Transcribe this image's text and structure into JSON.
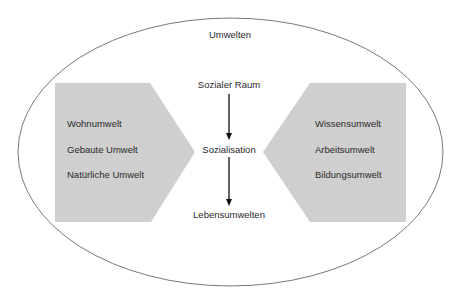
{
  "diagram": {
    "outer_label": "Umwelten",
    "center_flow": [
      "Sozialer Raum",
      "Sozialisation",
      "Lebensumwelten"
    ],
    "left_block": {
      "items": [
        "Wohnumwelt",
        "Gebaute Umwelt",
        "Natürliche Umwelt"
      ]
    },
    "right_block": {
      "items": [
        "Wissensumwelt",
        "Arbeitsumwelt",
        "Bildungsumwelt"
      ]
    },
    "colors": {
      "block_fill": "#cfcfcf",
      "ellipse_stroke": "#7a7a7a",
      "arrow": "#111111"
    }
  }
}
